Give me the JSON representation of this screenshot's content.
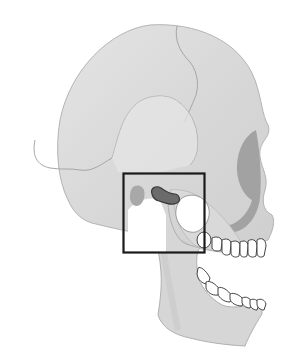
{
  "figure": {
    "colors": {
      "background": "#ffffff",
      "bone": "#dcdcdc",
      "bone_light": "#ececec",
      "suture": "#a8a8a8",
      "outline": "#9a9a9a",
      "orbit_shadow": "#9c9c9c",
      "articular_disc": "#6a6a6a",
      "eminence": "#b0b0b0",
      "highlight_box": "#1a1a1a",
      "teeth_fill": "#ffffff",
      "teeth_outline": "#444444"
    },
    "highlight_box": {
      "x": 123,
      "y": 173,
      "width": 81,
      "height": 79
    }
  }
}
